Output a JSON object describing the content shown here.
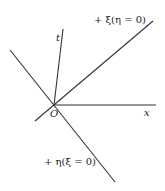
{
  "diagram": {
    "colors": {
      "line": "#333333",
      "text": "#222222",
      "background": "#ffffff"
    },
    "origin_label": "O",
    "axes": {
      "x_label": "x",
      "t_label": "t"
    },
    "characteristics": {
      "xi_label": "+ ξ(η = 0)",
      "eta_label": "+ η(ξ = 0)"
    }
  }
}
